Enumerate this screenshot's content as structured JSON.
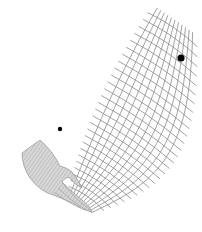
{
  "illustration": {
    "description": "Hand releasing a curving mesh/net that sweeps upward to the right, with two black dots",
    "background": "#ffffff",
    "mesh_color": "#8a8a8a",
    "hand_fill": "#d4d4d4",
    "hand_stripe": "#a8a8a8",
    "hand_outline": "#9a9a9a",
    "dots": [
      {
        "name": "large-dot",
        "cx": 181,
        "cy": 58,
        "r": 3.6,
        "color": "#000000"
      },
      {
        "name": "small-dot",
        "cx": 60,
        "cy": 129,
        "r": 2.2,
        "color": "#000000"
      }
    ]
  }
}
